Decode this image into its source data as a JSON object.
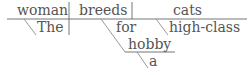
{
  "diagram": {
    "type": "sentence-diagram",
    "sentence": "The woman breeds cats for a hobby high-class",
    "subject": "woman",
    "subject_modifiers": [
      "The"
    ],
    "predicate": "breeds",
    "predicate_modifiers": [
      {
        "preposition": "for",
        "object": "hobby",
        "object_modifiers": [
          "a"
        ]
      }
    ],
    "direct_object": "cats",
    "object_modifiers": [
      "high-class"
    ]
  },
  "words": {
    "subject": "woman",
    "predicate": "breeds",
    "object": "cats",
    "article_the": "The",
    "preposition": "for",
    "object_modifier": "high-class",
    "prep_object": "hobby",
    "article_a": "a"
  },
  "colors": {
    "text": "#555555",
    "lines": "#777777",
    "background": "#ffffff"
  }
}
